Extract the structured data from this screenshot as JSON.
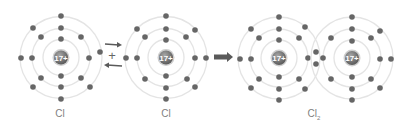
{
  "colors": {
    "shell": "#e4e4e4",
    "electron": "#666666",
    "nucleus_dark": "#5e5e5e",
    "nucleus_light": "#9a9a9a",
    "nucleus_ring": "#cfcfcf",
    "arrow": "#5a5a5a",
    "label": "#808080"
  },
  "nucleus_charge": "17+",
  "plus_sign": "+",
  "atoms": [
    {
      "id": "cl-atom-1",
      "label": "Cl",
      "cx": 61,
      "cy": 57.5,
      "shells": [
        18,
        29,
        41
      ],
      "electrons": [
        [
          61,
          39
        ],
        [
          61,
          76
        ],
        [
          61,
          28
        ],
        [
          41,
          37
        ],
        [
          32,
          58
        ],
        [
          41,
          78
        ],
        [
          61,
          87
        ],
        [
          81,
          78
        ],
        [
          89,
          58
        ],
        [
          81,
          37
        ],
        [
          61,
          16
        ],
        [
          33,
          28
        ],
        [
          21,
          58
        ],
        [
          33,
          87
        ],
        [
          61,
          99
        ],
        [
          90,
          87
        ],
        [
          100,
          52
        ]
      ]
    },
    {
      "id": "cl-atom-2",
      "label": "Cl",
      "cx": 166,
      "cy": 57.5,
      "shells": [
        18,
        29,
        41
      ],
      "electrons": [
        [
          166,
          40
        ],
        [
          166,
          76
        ],
        [
          166,
          29
        ],
        [
          145,
          37
        ],
        [
          137,
          58
        ],
        [
          145,
          79
        ],
        [
          166,
          88
        ],
        [
          187,
          79
        ],
        [
          195,
          58
        ],
        [
          186,
          37
        ],
        [
          166,
          16
        ],
        [
          137,
          29
        ],
        [
          126,
          58
        ],
        [
          166,
          99
        ],
        [
          195,
          30
        ],
        [
          206,
          58
        ],
        [
          195,
          87
        ]
      ]
    },
    {
      "id": "cl2-atom-left",
      "cx": 279,
      "cy": 58,
      "shells": [
        18,
        29,
        41
      ],
      "electrons": [
        [
          279,
          40
        ],
        [
          279,
          77
        ],
        [
          279,
          29
        ],
        [
          259,
          38
        ],
        [
          251,
          59
        ],
        [
          259,
          79
        ],
        [
          279,
          89
        ],
        [
          299,
          79
        ],
        [
          308,
          58
        ],
        [
          299,
          38
        ],
        [
          279,
          17
        ],
        [
          251,
          29
        ],
        [
          240,
          59
        ],
        [
          251,
          88
        ],
        [
          279,
          100
        ],
        [
          305,
          27
        ],
        [
          305,
          89
        ]
      ]
    },
    {
      "id": "cl2-atom-right",
      "cx": 352,
      "cy": 58,
      "shells": [
        18,
        29,
        41
      ],
      "electrons": [
        [
          352,
          41
        ],
        [
          352,
          77
        ],
        [
          352,
          29
        ],
        [
          331,
          38
        ],
        [
          323,
          58
        ],
        [
          331,
          79
        ],
        [
          352,
          89
        ],
        [
          371,
          79
        ],
        [
          380,
          59
        ],
        [
          371,
          38
        ],
        [
          352,
          17
        ],
        [
          380,
          31
        ],
        [
          391,
          59
        ],
        [
          380,
          88
        ],
        [
          352,
          100
        ],
        [
          316,
          52
        ],
        [
          316,
          64
        ]
      ]
    }
  ],
  "labels": [
    {
      "text": "Cl",
      "x": 60
    },
    {
      "text": "Cl",
      "x": 166
    },
    {
      "text": "Cl",
      "sub": "2",
      "x": 314
    }
  ],
  "arrows": {
    "equilibrium": {
      "top": {
        "x1": 105,
        "x2": 122,
        "y": 45
      },
      "bottom": {
        "x1": 122,
        "x2": 104,
        "y": 65
      },
      "plus": {
        "x": 112,
        "y": 55
      }
    },
    "reaction": {
      "x1": 214,
      "x2": 233,
      "y": 57
    }
  }
}
